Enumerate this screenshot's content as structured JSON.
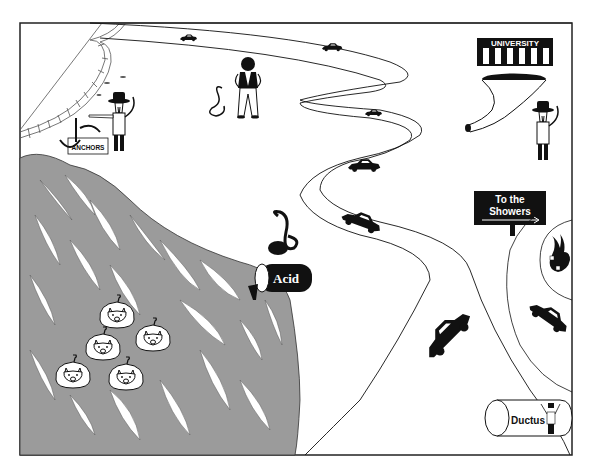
{
  "scene": {
    "title": "Cartoon landscape: winding road, acid-polluted river, university and showers",
    "colors": {
      "background": "#ffffff",
      "frame": "#222222",
      "river": "#9b9b9b",
      "ink": "#111111"
    }
  },
  "labels": {
    "university_sign": "UNIVERSITY",
    "showers_sign_line1": "To the",
    "showers_sign_line2": "Showers",
    "anchors_sign": "ANCHORS",
    "acid_barrel": "Acid",
    "ductus_pipe": "Ductus"
  },
  "elements": [
    {
      "name": "railway-track",
      "region": "top-left"
    },
    {
      "name": "prospector-pointing",
      "region": "top-left",
      "holds": "pickaxe"
    },
    {
      "name": "anchors-sign",
      "region": "top-left"
    },
    {
      "name": "biker-figure",
      "region": "top-center"
    },
    {
      "name": "snake",
      "region": "top-center"
    },
    {
      "name": "winding-road",
      "region": "center",
      "cars": 7
    },
    {
      "name": "university-building",
      "region": "top-right"
    },
    {
      "name": "funnel-tube",
      "region": "top-right"
    },
    {
      "name": "prospector-standing",
      "region": "top-right"
    },
    {
      "name": "showers-sign",
      "region": "right"
    },
    {
      "name": "burning-figure",
      "region": "right"
    },
    {
      "name": "acid-barrel",
      "region": "center-left"
    },
    {
      "name": "river",
      "region": "left",
      "fill": "gray"
    },
    {
      "name": "swimming-pigs",
      "region": "left",
      "count": 5
    },
    {
      "name": "ductus-pipe",
      "region": "bottom-right"
    }
  ]
}
